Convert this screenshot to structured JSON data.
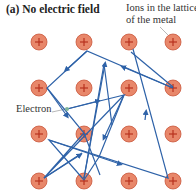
{
  "title": "(a) No electric field",
  "labels": {
    "ions": "Ions in the lattice of the metal",
    "electron": "Electron"
  },
  "colors": {
    "ion_fill": "#e8876a",
    "ion_stroke": "#c9553a",
    "ion_sign": "#b8321e",
    "path": "#2e62a8",
    "electron": "#7fb59a"
  },
  "ion_symbol": "+",
  "ions": {
    "cols": [
      39,
      84,
      129,
      173
    ],
    "rows": [
      42,
      88,
      134,
      181
    ]
  }
}
